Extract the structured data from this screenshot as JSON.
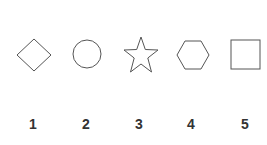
{
  "figure": {
    "stroke_color": "#555555",
    "shapes": [
      {
        "name": "diamond",
        "label": "1"
      },
      {
        "name": "circle",
        "label": "2"
      },
      {
        "name": "star",
        "label": "3"
      },
      {
        "name": "hexagon",
        "label": "4"
      },
      {
        "name": "square",
        "label": "5"
      }
    ]
  }
}
